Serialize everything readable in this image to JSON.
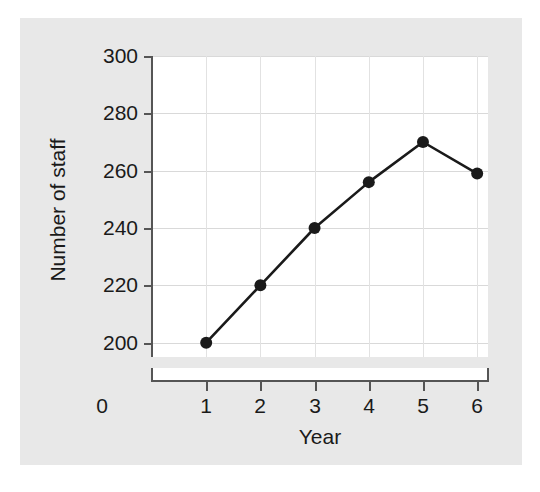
{
  "chart_data": {
    "type": "line",
    "title": "",
    "xlabel": "Year",
    "ylabel": "Number of staff",
    "x": [
      1,
      2,
      3,
      4,
      5,
      6
    ],
    "values": [
      200,
      220,
      240,
      256,
      270,
      259
    ],
    "series": [
      {
        "name": "Number of staff",
        "values": [
          200,
          220,
          240,
          256,
          270,
          259
        ]
      }
    ],
    "xlim": [
      0,
      6.2
    ],
    "ylim": [
      195,
      300
    ],
    "x_ticks": [
      0,
      1,
      2,
      3,
      4,
      5,
      6
    ],
    "x_tick_labels": [
      "0",
      "1",
      "2",
      "3",
      "4",
      "5",
      "6"
    ],
    "y_ticks": [
      200,
      220,
      240,
      260,
      280,
      300
    ],
    "y_tick_labels": [
      "200",
      "220",
      "240",
      "260",
      "280",
      "300"
    ],
    "grid": true,
    "legend": "none",
    "axis_break": true,
    "marker": "filled-circle",
    "line_color": "#1a1a1a",
    "marker_color": "#1a1a1a",
    "grid_color": "#d9d9d9",
    "figure_background": "#e8e8e8",
    "plot_background": "#ffffff"
  },
  "axes": {
    "x_title": "Year",
    "y_title": "Number of staff"
  }
}
